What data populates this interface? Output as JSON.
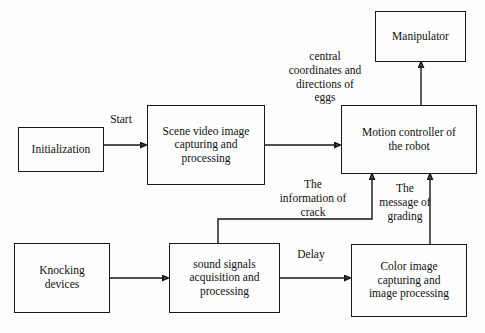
{
  "diagram": {
    "background_color": "#fdfdfd",
    "line_color": "#141414",
    "text_color": "#111111",
    "nodes": [
      {
        "id": "initialization",
        "label": "Initialization"
      },
      {
        "id": "scene_video",
        "label": "Scene video image\ncapturing and\nprocessing"
      },
      {
        "id": "motion_controller",
        "label": "Motion controller of\nthe robot"
      },
      {
        "id": "manipulator",
        "label": "Manipulator"
      },
      {
        "id": "knocking_devices",
        "label": "Knocking\ndevices"
      },
      {
        "id": "sound_signals",
        "label": "sound signals\nacquisition and\nprocessing"
      },
      {
        "id": "color_image",
        "label": "Color image\ncapturing and\nimage processing"
      }
    ],
    "edge_labels": [
      {
        "id": "start",
        "text": "Start"
      },
      {
        "id": "central_coordinates",
        "text": "central\ncoordinates and\ndirections of\neggs"
      },
      {
        "id": "information_of_crack",
        "text": "The\ninformation of\ncrack"
      },
      {
        "id": "message_of_grading",
        "text": "The\nmessage of\ngrading"
      },
      {
        "id": "delay",
        "text": "Delay"
      }
    ],
    "edges": [
      {
        "id": "init-to-scene",
        "from": "initialization",
        "to": "scene_video",
        "label": "Start"
      },
      {
        "id": "scene-to-controller",
        "from": "scene_video",
        "to": "motion_controller",
        "label": "central coordinates and directions of eggs"
      },
      {
        "id": "controller-to-manipulator",
        "from": "motion_controller",
        "to": "manipulator",
        "label": ""
      },
      {
        "id": "knocking-to-sound",
        "from": "knocking_devices",
        "to": "sound_signals",
        "label": ""
      },
      {
        "id": "sound-to-color",
        "from": "sound_signals",
        "to": "color_image",
        "label": "Delay"
      },
      {
        "id": "sound-to-controller",
        "from": "sound_signals",
        "to": "motion_controller",
        "label": "The information of crack"
      },
      {
        "id": "color-to-controller",
        "from": "color_image",
        "to": "motion_controller",
        "label": "The message of grading"
      }
    ]
  }
}
